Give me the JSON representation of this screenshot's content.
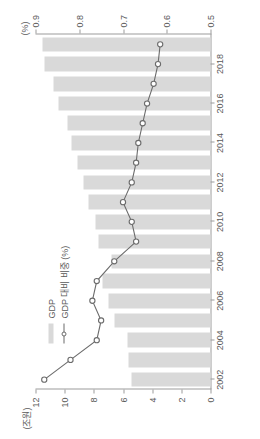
{
  "chart_data": {
    "type": "bar",
    "title": "",
    "subtitle": "",
    "xlabel": "",
    "ylabel": "(조원)",
    "y2label": "(%)",
    "grid": false,
    "legend_position": "inside-top-left",
    "orientation": "rotated-90-ccw",
    "categories": [
      "2002",
      "2003",
      "2004",
      "2005",
      "2006",
      "2007",
      "2008",
      "2009",
      "2010",
      "2011",
      "2012",
      "2013",
      "2014",
      "2015",
      "2016",
      "2017",
      "2018",
      "2019"
    ],
    "x_tick_labels": [
      "2002",
      "2004",
      "2006",
      "2008",
      "2010",
      "2012",
      "2014",
      "2016",
      "2018"
    ],
    "ylim": [
      0,
      12
    ],
    "y_tick_labels": [
      "0",
      "2",
      "4",
      "6",
      "8",
      "10",
      "12"
    ],
    "y2lim": [
      0.5,
      0.9
    ],
    "y2_tick_labels": [
      "0.5",
      "0.6",
      "0.7",
      "0.8",
      "0.9"
    ],
    "series": [
      {
        "name": "GDP",
        "type": "bar",
        "unit": "조원",
        "color": "#d9d9d9",
        "values": [
          5.4,
          5.6,
          5.7,
          6.6,
          7.0,
          7.4,
          6.8,
          7.7,
          7.9,
          8.4,
          8.7,
          9.1,
          9.5,
          9.8,
          10.4,
          10.8,
          11.4,
          11.5
        ]
      },
      {
        "name": "GDP 대비 비중 (%)",
        "type": "line",
        "unit": "%",
        "color": "#6b6b6b",
        "marker": "circle-open",
        "values": [
          0.88,
          0.82,
          0.76,
          0.75,
          0.77,
          0.76,
          0.72,
          0.67,
          0.68,
          0.7,
          0.68,
          0.67,
          0.665,
          0.655,
          0.645,
          0.63,
          0.62,
          0.615
        ]
      }
    ]
  },
  "legend": {
    "items": [
      {
        "label": "GDP",
        "swatch": "bar-swatch"
      },
      {
        "label": "GDP 대비 비중 (%)",
        "swatch": "line-marker-swatch"
      }
    ]
  },
  "axes": {
    "left_title": "(조원)",
    "right_title": "(%)"
  },
  "colors": {
    "bar": "#d9d9d9",
    "line": "#6b6b6b",
    "axis": "#9b9b9b",
    "text": "#5a5a5a",
    "background": "#ffffff"
  }
}
